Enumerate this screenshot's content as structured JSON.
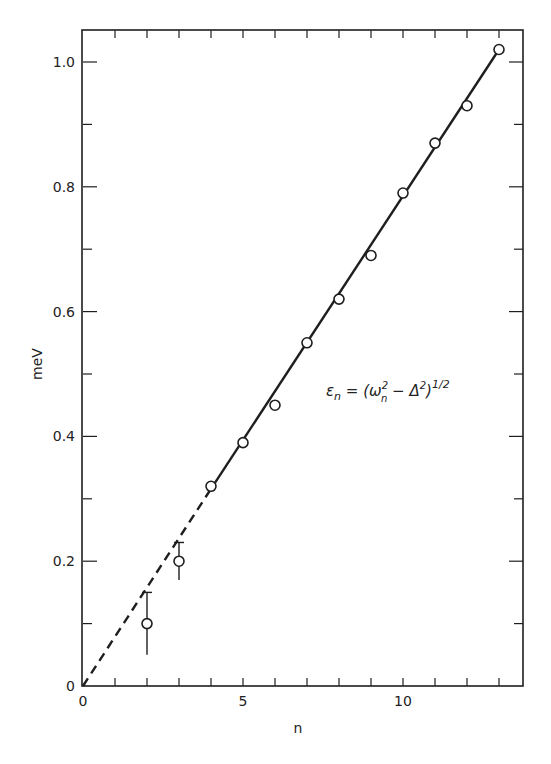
{
  "chart_data": {
    "type": "scatter",
    "title": "",
    "xlabel": "n",
    "ylabel": "meV",
    "xlim": [
      0,
      13.8
    ],
    "ylim": [
      0,
      1.06
    ],
    "grid": false,
    "legend": null,
    "x_ticks": {
      "major": [
        0,
        5,
        10
      ],
      "major_labels": [
        "0",
        "5",
        "10"
      ],
      "minor_step": 1
    },
    "y_ticks": {
      "major": [
        0,
        0.2,
        0.4,
        0.6,
        0.8,
        1.0
      ],
      "major_labels": [
        "0",
        "0.2",
        "0.4",
        "0.6",
        "0.8",
        "1.0"
      ],
      "minor_step": 0.1
    },
    "series": [
      {
        "name": "measured",
        "marker": "open-circle",
        "x": [
          2,
          3,
          4,
          5,
          6,
          7,
          8,
          9,
          10,
          11,
          12,
          13
        ],
        "y": [
          0.1,
          0.2,
          0.32,
          0.39,
          0.45,
          0.55,
          0.62,
          0.69,
          0.79,
          0.87,
          0.93,
          1.02
        ],
        "error_bars": [
          {
            "x": 2,
            "low": 0.05,
            "high": 0.15
          },
          {
            "x": 3,
            "low": 0.17,
            "high": 0.23
          }
        ]
      },
      {
        "name": "fit (dashed extrapolation)",
        "style": "dashed",
        "x": [
          0,
          4
        ],
        "y": [
          0.0,
          0.316
        ]
      },
      {
        "name": "fit (solid)",
        "style": "solid",
        "x": [
          4,
          13
        ],
        "y": [
          0.316,
          1.02
        ]
      }
    ],
    "annotations": [
      {
        "text": "εn = (ωn² − Δ²)^1/2",
        "x": 8.9,
        "y": 0.44
      }
    ]
  },
  "labels": {
    "xlabel": "n",
    "ylabel": "meV",
    "annotation_main": "ε",
    "annotation_sub_n": "n",
    "annotation_eq": " = (ω",
    "annotation_sup_2a": "2",
    "annotation_sub_n2": "n",
    "annotation_minus": " − Δ",
    "annotation_sup_2b": "2",
    "annotation_close": ")",
    "annotation_sup_half": "1/2"
  },
  "style": {
    "ink": "#1e1e1e",
    "background": "#ffffff"
  }
}
